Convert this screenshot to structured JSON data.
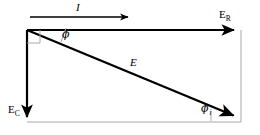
{
  "figure": {
    "type": "phasor-diagram",
    "background_color": "#ffffff",
    "stroke_color": "#000000",
    "guide_color": "#a8a8a8",
    "labels": {
      "current": "I",
      "resistor_voltage_main": "E",
      "resistor_voltage_sub": "R",
      "capacitor_voltage_main": "E",
      "capacitor_voltage_sub": "C",
      "total_voltage": "E",
      "angle_top": "ϕ",
      "angle_bottom": "ϕ",
      "angle_bottom_sub": "i"
    },
    "vectors": [
      {
        "name": "I",
        "label": "I",
        "from": [
          30,
          17
        ],
        "to": [
          130,
          17
        ],
        "kind": "reference-current"
      },
      {
        "name": "E_R",
        "label": "E",
        "from": [
          27,
          30
        ],
        "to": [
          237,
          30
        ],
        "kind": "resistive"
      },
      {
        "name": "E_C",
        "label": "E",
        "from": [
          27,
          30
        ],
        "to": [
          27,
          120
        ],
        "kind": "capacitive"
      },
      {
        "name": "E",
        "label": "E",
        "from": [
          27,
          30
        ],
        "to": [
          237,
          117
        ],
        "kind": "resultant"
      }
    ],
    "markers": {
      "right_angle": {
        "at": [
          27,
          30
        ],
        "size": 12
      },
      "angle_arc_top": {
        "at": [
          27,
          30
        ]
      },
      "angle_tick_bottom": {
        "at": [
          211,
          117
        ]
      }
    },
    "guides": [
      {
        "name": "right-frame",
        "from": [
          241,
          30
        ],
        "to": [
          241,
          122
        ]
      },
      {
        "name": "bottom-frame",
        "from": [
          27,
          122
        ],
        "to": [
          241,
          122
        ]
      }
    ]
  }
}
